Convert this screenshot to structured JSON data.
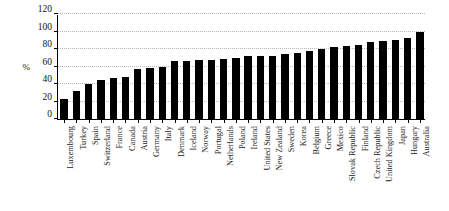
{
  "chart_data": {
    "type": "bar",
    "title": "",
    "xlabel": "",
    "ylabel": "%",
    "ylim": [
      0,
      120
    ],
    "yticks": [
      0,
      20,
      40,
      60,
      80,
      100,
      120
    ],
    "grid": true,
    "legend": "none",
    "bar_color": "#000000",
    "categories": [
      "Luxembourg",
      "Turkey",
      "Spain",
      "Switzerland",
      "France",
      "Canada",
      "Austria",
      "Germany",
      "Italy",
      "Denmark",
      "Iceland",
      "Norway",
      "Portugal",
      "Netherlands",
      "Poland",
      "Ireland",
      "United States",
      "New Zealand",
      "Sweden",
      "Korea",
      "Belgium",
      "Greece",
      "Mexico",
      "Slovak Republic",
      "Finland",
      "Czech Republic",
      "United Kingdom",
      "Japan",
      "Hungary",
      "Australia"
    ],
    "values": [
      23,
      32,
      40,
      45,
      47,
      48,
      57,
      58,
      60,
      66,
      66,
      67,
      68,
      69,
      70,
      72,
      72,
      72,
      74,
      76,
      78,
      80,
      82,
      84,
      85,
      88,
      89,
      90,
      93,
      100
    ]
  }
}
